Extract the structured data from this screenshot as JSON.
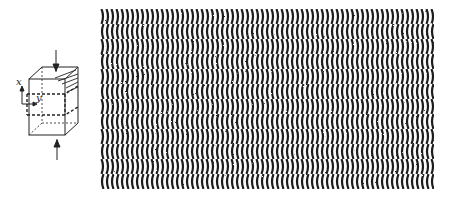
{
  "figure": {
    "type": "interference-fringe-illustration",
    "cube_diagram": {
      "axis_labels": {
        "x": "x",
        "y": "y"
      },
      "arrows": [
        "compression-top",
        "compression-bottom"
      ]
    },
    "fringe_pattern": {
      "description": "wavy vertical interference fringes in horizontal bands",
      "stripe_color": "#1e1e1e",
      "background_color": "#ffffff",
      "band_count": 12,
      "stripe_period_px": 5
    }
  }
}
